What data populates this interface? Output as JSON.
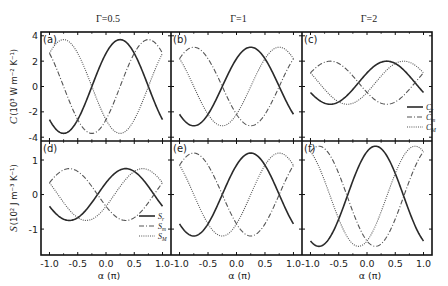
{
  "chart_data": {
    "type": "line",
    "layout": {
      "rows": 2,
      "cols": 3,
      "shared_x": true,
      "shared_y_per_row": true,
      "grid": false
    },
    "column_titles": [
      "Γ=0.5",
      "Γ=1",
      "Γ=2"
    ],
    "xlabel": "α (π)",
    "xticks": [
      -1.0,
      -0.5,
      0.0,
      0.5,
      1.0
    ],
    "xtick_labels": [
      "-1.0",
      "-0.5",
      "0.0",
      "0.5",
      "1.0"
    ],
    "xlim": [
      -1.15,
      1.15
    ],
    "rows": [
      {
        "ylabel": "C (10³ W m⁻² K⁻¹)",
        "ylabel_main": "C",
        "ylabel_unit": "(10³ W m⁻² K⁻¹)",
        "yticks": [
          -4,
          -2,
          0,
          2,
          4
        ],
        "ylim": [
          -4.3,
          4.3
        ],
        "legend": {
          "panel": "c",
          "entries": [
            "C_r",
            "C_m",
            "C_M"
          ],
          "styles": [
            "solid",
            "dashdot",
            "dotted"
          ]
        }
      },
      {
        "ylabel": "S (10² J m⁻³ K⁻¹)",
        "ylabel_main": "S",
        "ylabel_unit": "(10² J m⁻³ K⁻¹)",
        "yticks": [
          -1,
          0,
          1
        ],
        "ylim": [
          -1.75,
          1.55
        ],
        "legend": {
          "panel": "d",
          "entries": [
            "S_r",
            "S_m",
            "S_M"
          ],
          "styles": [
            "solid",
            "dashdot",
            "dotted"
          ]
        }
      }
    ],
    "panels": [
      {
        "label": "(a)",
        "row": 0,
        "col": 0,
        "gamma": 0.5,
        "series": [
          {
            "name": "C_r",
            "style": "solid",
            "amplitude": 3.7,
            "peak_alpha": 0.25,
            "offset": 0
          },
          {
            "name": "C_m",
            "style": "dashdot",
            "amplitude": 3.7,
            "peak_alpha": 0.75,
            "offset": 0
          },
          {
            "name": "C_M",
            "style": "dotted",
            "amplitude": 3.7,
            "peak_alpha": -0.75,
            "offset": 0
          }
        ]
      },
      {
        "label": "(b)",
        "row": 0,
        "col": 1,
        "gamma": 1,
        "series": [
          {
            "name": "C_r",
            "style": "solid",
            "amplitude": 3.1,
            "peak_alpha": 0.25,
            "offset": 0
          },
          {
            "name": "C_m",
            "style": "dashdot",
            "amplitude": 3.1,
            "peak_alpha": -0.75,
            "offset": 0
          },
          {
            "name": "C_M",
            "style": "dotted",
            "amplitude": 3.1,
            "peak_alpha": 0.75,
            "offset": 0
          }
        ]
      },
      {
        "label": "(c)",
        "row": 0,
        "col": 2,
        "gamma": 2,
        "series": [
          {
            "name": "C_r",
            "style": "solid",
            "amplitude": 1.7,
            "peak_alpha": 0.35,
            "offset": 0.3
          },
          {
            "name": "C_m",
            "style": "dashdot",
            "amplitude": 1.7,
            "peak_alpha": -0.65,
            "offset": 0.3
          },
          {
            "name": "C_M",
            "style": "dotted",
            "amplitude": 1.7,
            "peak_alpha": 0.65,
            "offset": 0.3
          }
        ]
      },
      {
        "label": "(d)",
        "row": 1,
        "col": 0,
        "gamma": 0.5,
        "series": [
          {
            "name": "S_r",
            "style": "solid",
            "amplitude": 0.75,
            "peak_alpha": 0.35,
            "offset": 0
          },
          {
            "name": "S_m",
            "style": "dashdot",
            "amplitude": 0.75,
            "peak_alpha": -0.65,
            "offset": 0
          },
          {
            "name": "S_M",
            "style": "dotted",
            "amplitude": 0.75,
            "peak_alpha": 0.65,
            "offset": 0
          }
        ]
      },
      {
        "label": "(e)",
        "row": 1,
        "col": 1,
        "gamma": 1,
        "series": [
          {
            "name": "S_r",
            "style": "solid",
            "amplitude": 1.2,
            "peak_alpha": 0.25,
            "offset": 0
          },
          {
            "name": "S_m",
            "style": "dashdot",
            "amplitude": 1.2,
            "peak_alpha": -0.75,
            "offset": 0
          },
          {
            "name": "S_M",
            "style": "dotted",
            "amplitude": 1.2,
            "peak_alpha": 0.75,
            "offset": 0
          }
        ]
      },
      {
        "label": "(f)",
        "row": 1,
        "col": 2,
        "gamma": 2,
        "series": [
          {
            "name": "S_r",
            "style": "solid",
            "amplitude": 1.45,
            "peak_alpha": 0.15,
            "offset": -0.05
          },
          {
            "name": "S_m",
            "style": "dashdot",
            "amplitude": 1.45,
            "peak_alpha": -0.85,
            "offset": -0.05
          },
          {
            "name": "S_M",
            "style": "dotted",
            "amplitude": 1.45,
            "peak_alpha": 0.85,
            "offset": -0.05
          }
        ]
      }
    ]
  }
}
